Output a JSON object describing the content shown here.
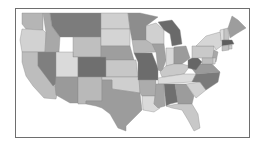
{
  "map": {
    "type": "choropleth",
    "region": "United States (contiguous)",
    "palette": {
      "lightest": "#d9d9d9",
      "light": "#c2c2c2",
      "medium": "#a6a6a6",
      "dark": "#8a8a8a",
      "darkest": "#6e6e6e",
      "border": "#6e6e6e",
      "background": "#ffffff"
    },
    "states": [
      {
        "id": "WA",
        "fill": "#b5b5b5",
        "points": "22,13 43,13 43,30 26,29 22,24"
      },
      {
        "id": "OR",
        "fill": "#d2d2d2",
        "points": "22,29 43,30 46,33 45,52 22,52 20,40"
      },
      {
        "id": "CA",
        "fill": "#bdbdbd",
        "points": "22,52 38,52 38,66 58,90 56,99 44,98 33,86 26,76 22,62"
      },
      {
        "id": "NV",
        "fill": "#7f7f7f",
        "points": "38,52 56,52 56,84 53,86 38,66"
      },
      {
        "id": "ID",
        "fill": "#a8a8a8",
        "points": "43,13 50,13 52,26 57,33 60,37 59,52 45,52 46,33"
      },
      {
        "id": "MT",
        "fill": "#7c7c7c",
        "points": "50,13 101,13 101,37 60,37 57,33 52,26"
      },
      {
        "id": "WY",
        "fill": "#bfbfbf",
        "points": "73,37 101,37 101,57 73,57"
      },
      {
        "id": "UT",
        "fill": "#dadada",
        "points": "59,52 73,52 73,57 78,57 78,77 56,77 56,52"
      },
      {
        "id": "AZ",
        "fill": "#9a9a9a",
        "points": "56,77 78,77 78,103 70,103 56,95 55,86"
      },
      {
        "id": "CO",
        "fill": "#6f6f6f",
        "points": "78,57 106,57 106,77 78,77"
      },
      {
        "id": "NM",
        "fill": "#b9b9b9",
        "points": "78,77 102,77 102,101 86,101 86,104 78,104"
      },
      {
        "id": "ND",
        "fill": "#cfcfcf",
        "points": "101,13 128,13 130,29 101,29"
      },
      {
        "id": "SD",
        "fill": "#d4d4d4",
        "points": "101,29 130,29 130,46 101,46"
      },
      {
        "id": "NE",
        "fill": "#9e9e9e",
        "points": "101,46 130,46 134,60 106,60 106,57 101,57"
      },
      {
        "id": "KS",
        "fill": "#c7c7c7",
        "points": "106,60 136,60 138,77 106,77"
      },
      {
        "id": "OK",
        "fill": "#cfcfcf",
        "points": "102,77 139,77 140,93 126,91 112,89 112,80 102,80"
      },
      {
        "id": "TX",
        "fill": "#9c9c9c",
        "points": "102,80 112,80 112,89 126,91 140,93 142,110 134,118 126,126 126,131 118,128 110,114 102,108 96,106 86,104 86,101 102,101"
      },
      {
        "id": "MN",
        "fill": "#8d8d8d",
        "points": "128,13 140,13 158,17 146,26 146,40 132,40 130,29"
      },
      {
        "id": "IA",
        "fill": "#b8b8b8",
        "points": "132,40 152,40 156,52 134,53"
      },
      {
        "id": "MO",
        "fill": "#6c6c6c",
        "points": "134,53 152,53 158,68 158,80 138,80 138,62"
      },
      {
        "id": "AR",
        "fill": "#acacac",
        "points": "139,80 156,80 156,96 142,96 140,93"
      },
      {
        "id": "LA",
        "fill": "#dadada",
        "points": "142,96 155,96 154,104 160,108 154,112 143,110"
      },
      {
        "id": "WI",
        "fill": "#d0d0d0",
        "points": "146,26 156,23 164,30 164,44 152,44 146,40"
      },
      {
        "id": "IL",
        "fill": "#a0a0a0",
        "points": "152,44 164,44 166,60 162,72 158,70 156,52"
      },
      {
        "id": "MI",
        "fill": "#6a6a6a",
        "points": "158,22 172,20 180,30 182,44 172,46 170,34 164,30"
      },
      {
        "id": "IN",
        "fill": "#d8d8d8",
        "points": "166,48 174,48 174,64 166,66 166,60"
      },
      {
        "id": "OH",
        "fill": "#9b9b9b",
        "points": "174,47 186,46 190,58 182,64 174,64"
      },
      {
        "id": "KY",
        "fill": "#c9c9c9",
        "points": "160,72 166,66 174,64 182,64 190,66 184,74 162,77"
      },
      {
        "id": "TN",
        "fill": "#dcdcdc",
        "points": "158,78 184,74 196,74 192,82 158,84"
      },
      {
        "id": "MS",
        "fill": "#a4a4a4",
        "points": "156,84 164,84 165,106 158,108 154,104 155,96 156,84"
      },
      {
        "id": "AL",
        "fill": "#6f6f6f",
        "points": "164,84 175,84 178,102 170,104 166,106"
      },
      {
        "id": "GA",
        "fill": "#9c9c9c",
        "points": "175,84 186,84 194,96 192,104 178,104"
      },
      {
        "id": "FL",
        "fill": "#c8c8c8",
        "points": "166,106 178,104 192,104 198,114 200,128 194,131 188,120 182,110 172,108"
      },
      {
        "id": "SC",
        "fill": "#d2d2d2",
        "points": "186,84 200,82 206,90 196,98"
      },
      {
        "id": "NC",
        "fill": "#7a7a7a",
        "points": "192,82 196,74 220,72 218,82 206,90 200,82"
      },
      {
        "id": "VA",
        "fill": "#9a9a9a",
        "points": "190,66 200,64 212,64 220,72 196,74"
      },
      {
        "id": "WV",
        "fill": "#666666",
        "points": "188,60 196,56 202,62 196,70 188,68"
      },
      {
        "id": "PA",
        "fill": "#c9c9c9",
        "points": "192,46 214,46 214,58 192,58"
      },
      {
        "id": "NY",
        "fill": "#d6d6d6",
        "points": "196,46 206,36 220,32 224,44 216,50 214,46"
      },
      {
        "id": "NJ",
        "fill": "#a8a8a8",
        "points": "214,50 218,52 216,62 212,60"
      },
      {
        "id": "MD",
        "fill": "#bdbdbd",
        "points": "202,58 214,58 214,64 202,64"
      },
      {
        "id": "DE",
        "fill": "#d4d4d4",
        "points": "213,58 216,58 215,64 213,64"
      },
      {
        "id": "VT",
        "fill": "#dedede",
        "points": "220,30 224,29 224,40 221,41"
      },
      {
        "id": "NH",
        "fill": "#c4c4c4",
        "points": "224,29 228,28 229,40 224,40"
      },
      {
        "id": "ME",
        "fill": "#9d9d9d",
        "points": "228,28 232,16 238,20 246,28 236,34 230,38"
      },
      {
        "id": "MA",
        "fill": "#5e5e5e",
        "points": "222,40 232,40 234,44 222,46"
      },
      {
        "id": "CT",
        "fill": "#c0c0c0",
        "points": "222,46 229,45 229,50 222,51"
      },
      {
        "id": "RI",
        "fill": "#cccccc",
        "points": "229,45 232,45 232,49 229,49"
      }
    ]
  }
}
